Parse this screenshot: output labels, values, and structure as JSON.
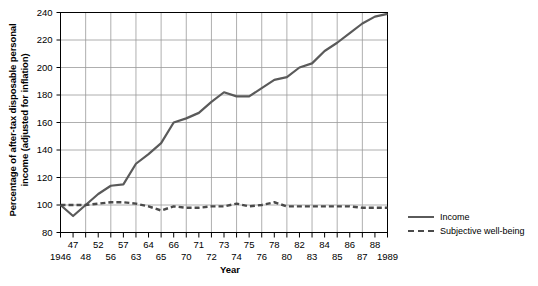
{
  "chart_data": {
    "type": "line",
    "title": "",
    "xlabel": "Year",
    "ylabel": "Percentage of after-tax disposable personal income (adjusted for inflation)",
    "ylabel_line1": "Percentage of after-tax disposable personal",
    "ylabel_line2": "income (adjusted for inflation)",
    "ylim": [
      80,
      240
    ],
    "yticks": [
      80,
      100,
      120,
      140,
      160,
      180,
      200,
      220,
      240
    ],
    "x": [
      "1946",
      "47",
      "48",
      "52",
      "56",
      "57",
      "63",
      "64",
      "65",
      "66",
      "70",
      "71",
      "72",
      "73",
      "74",
      "75",
      "76",
      "78",
      "80",
      "82",
      "83",
      "84",
      "85",
      "86",
      "87",
      "88",
      "1989"
    ],
    "xticks_upper": [
      "",
      "47",
      "",
      "52",
      "",
      "57",
      "",
      "64",
      "",
      "66",
      "",
      "71",
      "",
      "73",
      "",
      "75",
      "",
      "78",
      "",
      "82",
      "",
      "84",
      "",
      "86",
      "",
      "88",
      ""
    ],
    "xticks_lower": [
      "1946",
      "",
      "48",
      "",
      "56",
      "",
      "63",
      "",
      "65",
      "",
      "70",
      "",
      "72",
      "",
      "74",
      "",
      "76",
      "",
      "80",
      "",
      "83",
      "",
      "85",
      "",
      "87",
      "",
      "1989"
    ],
    "grid": true,
    "legend_position": "right",
    "series": [
      {
        "name": "Income",
        "style": "solid",
        "color": "#5a5a5a",
        "values": [
          100,
          92,
          100,
          108,
          114,
          115,
          130,
          137,
          145,
          160,
          163,
          167,
          175,
          182,
          179,
          179,
          185,
          191,
          193,
          200,
          203,
          212,
          218,
          225,
          232,
          237,
          239
        ]
      },
      {
        "name": "Subjective well-being",
        "style": "dashed",
        "color": "#4a4a4a",
        "values": [
          100,
          100,
          100,
          101,
          102,
          102,
          101,
          99,
          96,
          99,
          98,
          98,
          99,
          99,
          101,
          99,
          100,
          102,
          99,
          99,
          99,
          99,
          99,
          99,
          98,
          98,
          98
        ]
      }
    ]
  },
  "legend": {
    "items": [
      {
        "label": "Income"
      },
      {
        "label": "Subjective well-being"
      }
    ]
  },
  "axis": {
    "y_label": "Percentage of after-tax disposable personal income (adjusted for inflation)",
    "x_label": "Year"
  }
}
